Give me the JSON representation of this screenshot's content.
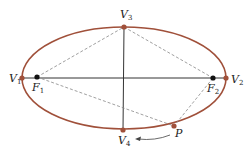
{
  "diagram": {
    "type": "ellipse-foci",
    "colors": {
      "ellipse": "#a0503a",
      "vertex_point": "#a0503a",
      "focus_point": "#111111",
      "axis": "#333333",
      "dashed": "#888888",
      "text": "#222222"
    },
    "ellipse": {
      "cx": 124,
      "cy": 78,
      "rx": 102,
      "ry": 51
    },
    "points": {
      "V1": {
        "label": "V",
        "sub": "1",
        "x": 22,
        "y": 78
      },
      "V2": {
        "label": "V",
        "sub": "2",
        "x": 226,
        "y": 78
      },
      "V3": {
        "label": "V",
        "sub": "3",
        "x": 124,
        "y": 27
      },
      "V4": {
        "label": "V",
        "sub": "4",
        "x": 123,
        "y": 130
      },
      "F1": {
        "label": "F",
        "sub": "1",
        "x": 37,
        "y": 77
      },
      "F2": {
        "label": "F",
        "sub": "2",
        "x": 213,
        "y": 78
      },
      "P": {
        "label": "P",
        "x": 174,
        "y": 126
      }
    },
    "labels": {
      "V1": "V",
      "V1_sub": "1",
      "V2": "V",
      "V2_sub": "2",
      "V3": "V",
      "V3_sub": "3",
      "V4": "V",
      "V4_sub": "4",
      "F1": "F",
      "F1_sub": "1",
      "F2": "F",
      "F2_sub": "2",
      "P": "P"
    }
  }
}
